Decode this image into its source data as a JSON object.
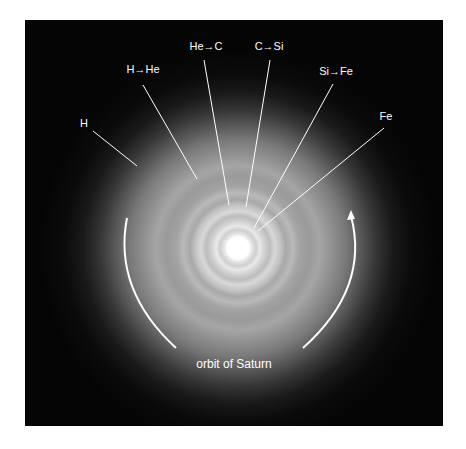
{
  "diagram": {
    "shells": [
      {
        "label": "H"
      },
      {
        "label": "H→He"
      },
      {
        "label": "He→C"
      },
      {
        "label": "C→Si"
      },
      {
        "label": "Si→Fe"
      },
      {
        "label": "Fe"
      }
    ],
    "orbit_label": "orbit of Saturn",
    "colors": {
      "background": "#050505",
      "foreground": "#ffffff",
      "page": "#ffffff"
    },
    "icons": {
      "orbit_arrow": "arrow-up-icon"
    }
  }
}
